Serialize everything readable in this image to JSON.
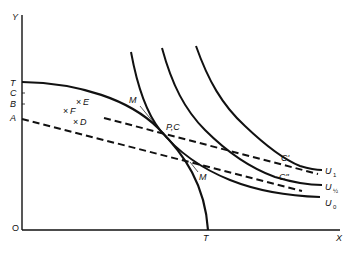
{
  "diagram": {
    "type": "economics-production-possibility-indifference",
    "axes": {
      "y_label": "Y",
      "x_label": "X",
      "origin_label": "O"
    },
    "y_axis_marks": [
      "T",
      "C",
      "B",
      "A"
    ],
    "x_axis_marks": [
      "T"
    ],
    "points": [
      {
        "label": "E",
        "marker": "×"
      },
      {
        "label": "F",
        "marker": "×"
      },
      {
        "label": "D",
        "marker": "×"
      }
    ],
    "curve_labels": {
      "m_upper": "M",
      "m_lower": "M",
      "tangency": "P,C",
      "c_prime": "C'",
      "c_double_prime": "C\""
    },
    "indifference_curves": [
      {
        "name": "U",
        "subscript": "1"
      },
      {
        "name": "U",
        "subscript": "½"
      },
      {
        "name": "U",
        "subscript": "0"
      }
    ],
    "colors": {
      "ink": "#111111",
      "background": "#ffffff"
    }
  }
}
